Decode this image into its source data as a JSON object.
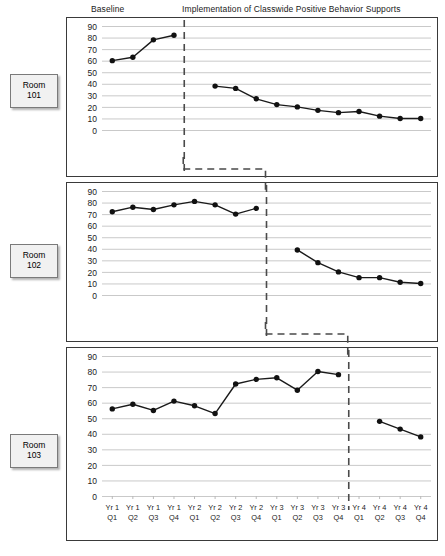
{
  "header": {
    "baseline_label": "Baseline",
    "implementation_label": "Implementation of Classwide Positive Behavior Supports"
  },
  "rooms": [
    {
      "line1": "Room",
      "line2": "101"
    },
    {
      "line1": "Room",
      "line2": "102"
    },
    {
      "line1": "Room",
      "line2": "103"
    }
  ],
  "axis": {
    "y_ticks": [
      90,
      80,
      70,
      60,
      50,
      40,
      30,
      20,
      10,
      0
    ],
    "y_min": 0,
    "y_max": 90,
    "x_tick_top": [
      "Yr 1",
      "Yr 1",
      "Yr 1",
      "Yr 1",
      "Yr 2",
      "Yr 2",
      "Yr 2",
      "Yr 2",
      "Yr 3",
      "Yr 3",
      "Yr 3",
      "Yr 3",
      "Yr 4",
      "Yr 4",
      "Yr 4",
      "Yr 4"
    ],
    "x_tick_bottom": [
      "Q1",
      "Q2",
      "Q3",
      "Q4",
      "Q1",
      "Q2",
      "Q3",
      "Q4",
      "Q1",
      "Q2",
      "Q3",
      "Q4",
      "Q1",
      "Q2",
      "Q3",
      "Q4"
    ]
  },
  "colors": {
    "line": "#1a1a1a",
    "marker": "#111111",
    "gridline": "#c9c9c9",
    "panel_border": "#3a3a3a",
    "phase_line": "#4a4a4a",
    "room_box_fill": "#f1f1f1",
    "room_box_border": "#7a7a7a"
  },
  "chart_data": {
    "type": "line",
    "title": "",
    "subtitle": "",
    "xlabel": "",
    "ylabel": "",
    "ylim": [
      0,
      90
    ],
    "grid": true,
    "legend": "none",
    "design": "multiple-baseline-across-settings",
    "x": [
      "Yr 1 Q1",
      "Yr 1 Q2",
      "Yr 1 Q3",
      "Yr 1 Q4",
      "Yr 2 Q1",
      "Yr 2 Q2",
      "Yr 2 Q3",
      "Yr 2 Q4",
      "Yr 3 Q1",
      "Yr 3 Q2",
      "Yr 3 Q3",
      "Yr 3 Q4",
      "Yr 4 Q1",
      "Yr 4 Q2",
      "Yr 4 Q3",
      "Yr 4 Q4"
    ],
    "panels": [
      {
        "name": "Room 101",
        "phase_change_after_index": 3,
        "series": [
          {
            "name": "Baseline",
            "x_index": [
              0,
              1,
              2,
              3
            ],
            "values": [
              60,
              63,
              78,
              82
            ]
          },
          {
            "name": "Implementation",
            "x_index": [
              5,
              6,
              7,
              8,
              9,
              10,
              11,
              12,
              13,
              14,
              15
            ],
            "values": [
              38,
              36,
              27,
              22,
              20,
              17,
              15,
              16,
              12,
              10,
              10
            ]
          }
        ]
      },
      {
        "name": "Room 102",
        "phase_change_after_index": 7,
        "series": [
          {
            "name": "Baseline",
            "x_index": [
              0,
              1,
              2,
              3,
              4,
              5,
              6,
              7
            ],
            "values": [
              72,
              76,
              74,
              78,
              81,
              78,
              70,
              75
            ]
          },
          {
            "name": "Implementation",
            "x_index": [
              9,
              10,
              11,
              12,
              13,
              14,
              15
            ],
            "values": [
              39,
              28,
              20,
              15,
              15,
              11,
              10
            ]
          }
        ]
      },
      {
        "name": "Room 103",
        "phase_change_after_index": 11,
        "series": [
          {
            "name": "Baseline",
            "x_index": [
              0,
              1,
              2,
              3,
              4,
              5,
              6,
              7,
              8,
              9,
              10,
              11
            ],
            "values": [
              56,
              59,
              55,
              61,
              58,
              53,
              72,
              75,
              76,
              68,
              80,
              78
            ]
          },
          {
            "name": "Implementation",
            "x_index": [
              13,
              14,
              15
            ],
            "values": [
              48,
              43,
              38
            ]
          }
        ]
      }
    ]
  }
}
